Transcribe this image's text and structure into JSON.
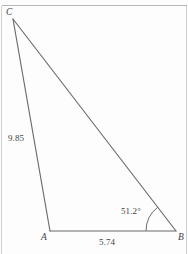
{
  "figure": {
    "type": "triangle-diagram",
    "background_color": "#fdfdfd",
    "stroke_color": "#6b6b6b",
    "border_color": "#b7b7b7",
    "vertices": {
      "C": {
        "label": "C",
        "x": 13,
        "y": 19
      },
      "A": {
        "label": "A",
        "x": 50,
        "y": 231
      },
      "B": {
        "label": "B",
        "x": 176,
        "y": 231
      }
    },
    "sides": [
      {
        "name": "CA",
        "from": "C",
        "to": "A",
        "label": "9.85"
      },
      {
        "name": "AB",
        "from": "A",
        "to": "B",
        "label": "5.74"
      },
      {
        "name": "CB",
        "from": "C",
        "to": "B",
        "label": ""
      }
    ],
    "angles": [
      {
        "name": "angle-B",
        "at": "B",
        "label": "51.2°"
      }
    ],
    "page_rules": {
      "top_rule": true,
      "left_rule": true,
      "right_rule": true
    }
  }
}
